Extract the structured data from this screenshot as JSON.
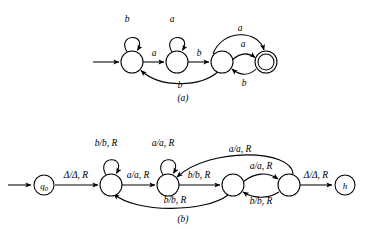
{
  "figure": {
    "background_color": "#ffffff",
    "stroke_color": "#000000",
    "panels": [
      {
        "id": "panel-a",
        "caption": "(a)",
        "type": "finite-state-machine",
        "description": "Deterministic finite automaton with four states and one accepting state",
        "states": [
          {
            "id": "a1",
            "label": "",
            "cx": 132,
            "cy": 62,
            "r": 11,
            "accepting": false,
            "start": true
          },
          {
            "id": "a2",
            "label": "",
            "cx": 177,
            "cy": 62,
            "r": 11,
            "accepting": false,
            "start": false
          },
          {
            "id": "a3",
            "label": "",
            "cx": 222,
            "cy": 62,
            "r": 11,
            "accepting": false,
            "start": false
          },
          {
            "id": "a4",
            "label": "",
            "cx": 266,
            "cy": 62,
            "r": 11,
            "accepting": true,
            "start": false
          }
        ],
        "transitions": [
          {
            "from": "a1",
            "to": "a1",
            "label": "b",
            "kind": "self-loop-top"
          },
          {
            "from": "a1",
            "to": "a2",
            "label": "a",
            "kind": "straight"
          },
          {
            "from": "a2",
            "to": "a2",
            "label": "a",
            "kind": "self-loop-top"
          },
          {
            "from": "a2",
            "to": "a3",
            "label": "b",
            "kind": "straight"
          },
          {
            "from": "a2",
            "to": "a1",
            "label": "b",
            "kind": "arc-below"
          },
          {
            "from": "a3",
            "to": "a4",
            "label": "a",
            "kind": "arc-above-short"
          },
          {
            "from": "a4",
            "to": "a3",
            "label": "b",
            "kind": "arc-below-short"
          },
          {
            "from": "a3",
            "to": "a4",
            "label": "a",
            "kind": "arc-above-long"
          }
        ]
      },
      {
        "id": "panel-b",
        "caption": "(b)",
        "type": "turing-machine",
        "description": "Turing machine transition diagram with start state q0 and halt state h",
        "states": [
          {
            "id": "b0",
            "label": "q0",
            "label_base": "q",
            "label_sub": "0",
            "cx": 44,
            "cy": 185,
            "r": 10,
            "accepting": false,
            "start": true
          },
          {
            "id": "b1",
            "label": "",
            "cx": 111,
            "cy": 185,
            "r": 11,
            "accepting": false,
            "start": false
          },
          {
            "id": "b2",
            "label": "",
            "cx": 168,
            "cy": 185,
            "r": 11,
            "accepting": false,
            "start": false
          },
          {
            "id": "b3",
            "label": "",
            "cx": 233,
            "cy": 185,
            "r": 11,
            "accepting": false,
            "start": false
          },
          {
            "id": "b4",
            "label": "",
            "cx": 289,
            "cy": 185,
            "r": 11,
            "accepting": false,
            "start": false
          },
          {
            "id": "b5",
            "label": "h",
            "cx": 345,
            "cy": 185,
            "r": 10,
            "accepting": false,
            "start": false
          }
        ],
        "transitions": [
          {
            "from": "b0",
            "to": "b1",
            "label": "Δ/Δ, R",
            "read": "Δ",
            "write": "Δ",
            "move": "R",
            "kind": "straight"
          },
          {
            "from": "b1",
            "to": "b1",
            "label": "b/b, R",
            "read": "b",
            "write": "b",
            "move": "R",
            "kind": "self-loop-top"
          },
          {
            "from": "b1",
            "to": "b2",
            "label": "a/a, R",
            "read": "a",
            "write": "a",
            "move": "R",
            "kind": "straight"
          },
          {
            "from": "b2",
            "to": "b2",
            "label": "a/a, R",
            "read": "a",
            "write": "a",
            "move": "R",
            "kind": "self-loop-top"
          },
          {
            "from": "b2",
            "to": "b3",
            "label": "b/b, R",
            "read": "b",
            "write": "b",
            "move": "R",
            "kind": "straight"
          },
          {
            "from": "b3",
            "to": "b1",
            "label": "b/b, R",
            "read": "b",
            "write": "b",
            "move": "R",
            "kind": "arc-below-long"
          },
          {
            "from": "b3",
            "to": "b4",
            "label": "a/a, R",
            "read": "a",
            "write": "a",
            "move": "R",
            "kind": "arc-above-short"
          },
          {
            "from": "b4",
            "to": "b3",
            "label": "b/b, R",
            "read": "b",
            "write": "b",
            "move": "R",
            "kind": "arc-below-short"
          },
          {
            "from": "b4",
            "to": "b2",
            "label": "a/a, R",
            "read": "a",
            "write": "a",
            "move": "R",
            "kind": "arc-above-long"
          },
          {
            "from": "b4",
            "to": "b5",
            "label": "Δ/Δ, R",
            "read": "Δ",
            "write": "Δ",
            "move": "R",
            "kind": "straight"
          }
        ]
      }
    ],
    "labels": {
      "a_loop1": "b",
      "a_loop2": "a",
      "a_12": "a",
      "a_23": "b",
      "a_21": "b",
      "a_34_long": "a",
      "a_34_short": "a",
      "a_43": "b",
      "caption_a": "(a)",
      "b_start": "Δ/Δ, R",
      "b_loop1": "b/b, R",
      "b_12": "a/a, R",
      "b_loop2": "a/a, R",
      "b_23": "b/b, R",
      "b_31": "b/b, R",
      "b_34": "a/a, R",
      "b_43": "b/b, R",
      "b_42": "a/a, R",
      "b_45": "Δ/Δ, R",
      "caption_b": "(b)",
      "state_q0_base": "q",
      "state_q0_sub": "0",
      "state_h": "h"
    }
  }
}
